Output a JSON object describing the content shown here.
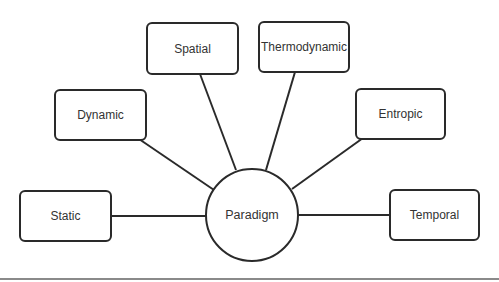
{
  "diagram": {
    "type": "hub-and-spoke",
    "center": {
      "label": "Paradigm"
    },
    "nodes": [
      {
        "id": "static",
        "label": "Static"
      },
      {
        "id": "dynamic",
        "label": "Dynamic"
      },
      {
        "id": "spatial",
        "label": "Spatial"
      },
      {
        "id": "thermodynamic",
        "label": "Thermodynamic"
      },
      {
        "id": "entropic",
        "label": "Entropic"
      },
      {
        "id": "temporal",
        "label": "Temporal"
      }
    ],
    "edges": [
      [
        "Paradigm",
        "Static"
      ],
      [
        "Paradigm",
        "Dynamic"
      ],
      [
        "Paradigm",
        "Spatial"
      ],
      [
        "Paradigm",
        "Thermodynamic"
      ],
      [
        "Paradigm",
        "Entropic"
      ],
      [
        "Paradigm",
        "Temporal"
      ]
    ],
    "stroke_color": "#2a2a2a"
  }
}
